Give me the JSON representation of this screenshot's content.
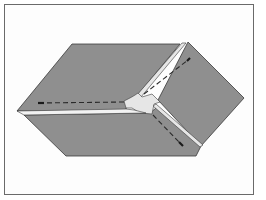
{
  "figure": {
    "colors": {
      "fabric": "#8f8f8f",
      "fabric_edge": "#3a3a3a",
      "seam_allowance": "#e6e6e6",
      "stitch": "#2a2a2a",
      "frame": "#6a6a6a",
      "background": "#ffffff"
    },
    "panels": [
      {
        "name": "top-left-panel"
      },
      {
        "name": "right-panel"
      },
      {
        "name": "bottom-panel"
      }
    ],
    "stitch_lines": [
      {
        "name": "horizontal-stitch"
      },
      {
        "name": "upper-diagonal-stitch"
      },
      {
        "name": "lower-diagonal-stitch"
      }
    ]
  }
}
